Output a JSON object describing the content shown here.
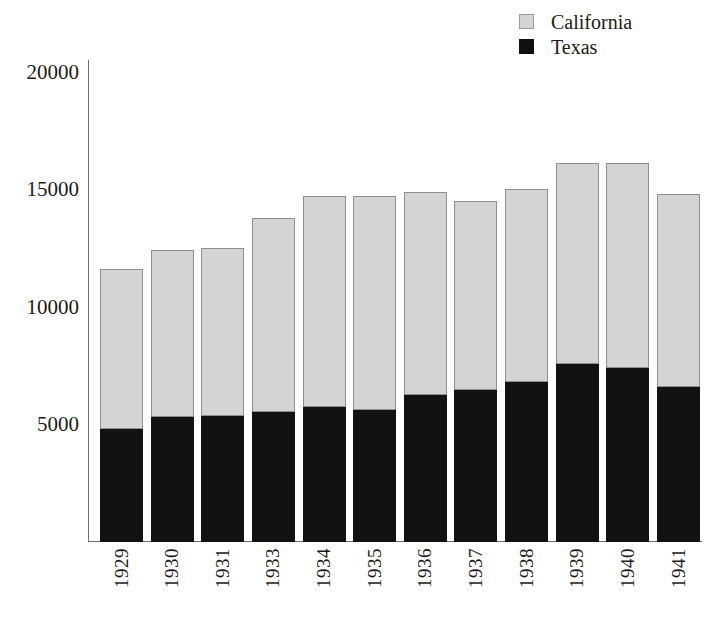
{
  "chart_data": {
    "type": "bar",
    "subtype": "stacked-bar",
    "title": "",
    "subtitle": "",
    "xlabel": "",
    "ylabel": "",
    "categories": [
      "1929",
      "1930",
      "1931",
      "1933",
      "1934",
      "1935",
      "1936",
      "1937",
      "1938",
      "1939",
      "1940",
      "1941"
    ],
    "series": [
      {
        "name": "Texas",
        "color": "#121212",
        "values": [
          4800,
          5300,
          5350,
          5550,
          5750,
          5600,
          6250,
          6450,
          6800,
          7550,
          7400,
          6600
        ]
      },
      {
        "name": "California",
        "color": "#d4d4d4",
        "values": [
          6800,
          7100,
          7150,
          8250,
          8950,
          9100,
          8650,
          8050,
          8200,
          8550,
          8700,
          8200
        ]
      }
    ],
    "totals": [
      11600,
      12400,
      12500,
      13800,
      14700,
      14700,
      14900,
      14500,
      15000,
      16100,
      16100,
      14800
    ],
    "stack_order": [
      "Texas",
      "California"
    ],
    "ylim": [
      0,
      20500
    ],
    "yticks": [
      5000,
      10000,
      15000,
      20000
    ],
    "ytick_labels": [
      "5000",
      "10000",
      "15000",
      "20000"
    ],
    "grid": false,
    "legend_position": "top-right",
    "legend_entries": [
      {
        "label": "California",
        "swatch": "california-swatch",
        "color": "#d4d4d4"
      },
      {
        "label": "Texas",
        "swatch": "texas-swatch",
        "color": "#121212"
      }
    ]
  },
  "axes": {
    "y_axis_name": "y-axis",
    "x_axis_name": "x-axis"
  }
}
